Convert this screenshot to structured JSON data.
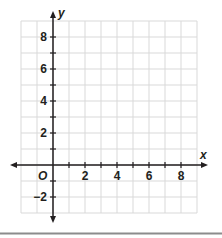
{
  "chart_data": {
    "type": "coordinate-grid",
    "title": "",
    "xlabel": "x",
    "ylabel": "y",
    "origin_label": "O",
    "xlim": [
      -2,
      9
    ],
    "ylim": [
      -3,
      9
    ],
    "grid": true,
    "grid_step": 1,
    "x_ticks": [
      1,
      2,
      3,
      4,
      5,
      6,
      7,
      8
    ],
    "y_ticks": [
      -2,
      -1,
      1,
      2,
      3,
      4,
      5,
      6,
      7,
      8
    ],
    "x_tick_labels": [
      {
        "value": 2,
        "label": "2"
      },
      {
        "value": 4,
        "label": "4"
      },
      {
        "value": 6,
        "label": "6"
      },
      {
        "value": 8,
        "label": "8"
      }
    ],
    "y_tick_labels": [
      {
        "value": 8,
        "label": "8"
      },
      {
        "value": 6,
        "label": "6"
      },
      {
        "value": 4,
        "label": "4"
      },
      {
        "value": 2,
        "label": "2"
      },
      {
        "value": -2,
        "label": "−2"
      }
    ],
    "series": [],
    "colors": {
      "grid": "#d9d9d9",
      "axis": "#231f20",
      "bottom_rule": "#8c8c8c"
    }
  }
}
